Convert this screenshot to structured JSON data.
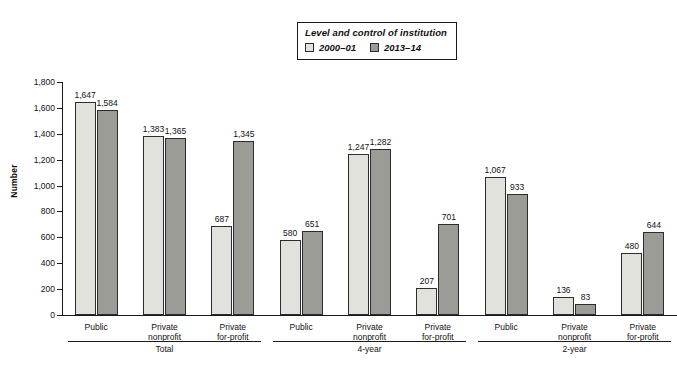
{
  "chart_data": {
    "type": "bar",
    "title": "",
    "xlabel": "",
    "ylabel": "Number",
    "ylim": [
      0,
      1800
    ],
    "ytick_step": 200,
    "yticks": [
      "0",
      "200",
      "400",
      "600",
      "800",
      "1,000",
      "1,200",
      "1,400",
      "1,600",
      "1,800"
    ],
    "grid": false,
    "legend_position": "top-center",
    "legend_title": "Level and control of institution",
    "categories": [
      "Public",
      "Private nonprofit",
      "Private for-profit",
      "Public",
      "Private nonprofit",
      "Private for-profit",
      "Public",
      "Private nonprofit",
      "Private for-profit"
    ],
    "series": [
      {
        "name": "2000–01",
        "color": "#e2e2dd",
        "values": [
          1647,
          1383,
          687,
          580,
          1247,
          207,
          1067,
          136,
          480
        ],
        "value_labels": [
          "1,647",
          "1,383",
          "687",
          "580",
          "1,247",
          "207",
          "1,067",
          "136",
          "480"
        ]
      },
      {
        "name": "2013–14",
        "color": "#9c9c97",
        "values": [
          1584,
          1365,
          1345,
          651,
          1282,
          701,
          933,
          83,
          644
        ],
        "value_labels": [
          "1,584",
          "1,365",
          "1,345",
          "651",
          "1,282",
          "701",
          "933",
          "83",
          "644"
        ]
      }
    ],
    "group_headers": [
      "Total",
      "4-year",
      "2-year"
    ],
    "groups": [
      {
        "label": "Total",
        "categories": [
          "Public",
          "Private nonprofit",
          "Private for-profit"
        ]
      },
      {
        "label": "4-year",
        "categories": [
          "Public",
          "Private nonprofit",
          "Private for-profit"
        ]
      },
      {
        "label": "2-year",
        "categories": [
          "Public",
          "Private nonprofit",
          "Private for-profit"
        ]
      }
    ]
  },
  "legend": {
    "title": "Level and control of institution",
    "entries": [
      {
        "label": "2000–01",
        "color": "#e2e2dd"
      },
      {
        "label": "2013–14",
        "color": "#9c9c97"
      }
    ]
  },
  "axis": {
    "y_title": "Number"
  },
  "category_labels": [
    {
      "line1": "Public",
      "line2": ""
    },
    {
      "line1": "Private",
      "line2": "nonprofit"
    },
    {
      "line1": "Private",
      "line2": "for-profit"
    },
    {
      "line1": "Public",
      "line2": ""
    },
    {
      "line1": "Private",
      "line2": "nonprofit"
    },
    {
      "line1": "Private",
      "line2": "for-profit"
    },
    {
      "line1": "Public",
      "line2": ""
    },
    {
      "line1": "Private",
      "line2": "nonprofit"
    },
    {
      "line1": "Private",
      "line2": "for-profit"
    }
  ],
  "group_labels": [
    "Total",
    "4-year",
    "2-year"
  ],
  "footnote": ""
}
